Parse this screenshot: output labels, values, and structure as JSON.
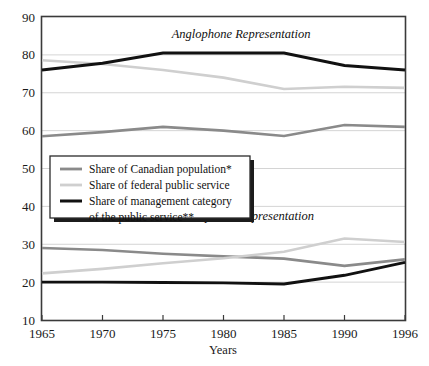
{
  "chart_data": {
    "type": "line",
    "title": "",
    "xlabel": "Years",
    "ylabel": "",
    "x": [
      1965,
      1970,
      1975,
      1980,
      1985,
      1990,
      1996
    ],
    "xtick_labels": [
      "1965",
      "1970",
      "1975",
      "1980",
      "1985",
      "1990",
      "1996"
    ],
    "ytick_labels": [
      "10",
      "20",
      "30",
      "40",
      "50",
      "60",
      "70",
      "80",
      "90"
    ],
    "yticks": [
      10,
      20,
      30,
      40,
      50,
      60,
      70,
      80,
      90
    ],
    "ylim": [
      10,
      90
    ],
    "grid": true,
    "legend_position": "center-left",
    "annotations": [
      {
        "text": "Anglophone Representation",
        "x": 1982,
        "y": 84.5
      },
      {
        "text": "Francophone Representation",
        "x": 1982,
        "y": 36.5
      }
    ],
    "series": [
      {
        "name": "Share of Canadian population*",
        "group": "Anglophone Representation",
        "color": "#8a8a8a",
        "width": 2.6,
        "values": [
          58.5,
          59.6,
          61.0,
          60.0,
          58.6,
          61.5,
          61.0
        ]
      },
      {
        "name": "Share of federal public service",
        "group": "Anglophone Representation",
        "color": "#cfcfcf",
        "width": 2.6,
        "values": [
          78.6,
          77.6,
          76.0,
          74.0,
          71.0,
          71.6,
          71.3
        ]
      },
      {
        "name": "Share of management category of the public service**",
        "group": "Anglophone Representation",
        "color": "#111111",
        "width": 2.9,
        "values": [
          76.0,
          77.8,
          80.5,
          80.5,
          80.5,
          77.2,
          76.0
        ]
      },
      {
        "name": "Share of Canadian population*",
        "group": "Francophone Representation",
        "color": "#8a8a8a",
        "width": 2.6,
        "values": [
          29.0,
          28.5,
          27.5,
          26.8,
          26.2,
          24.3,
          26.0
        ]
      },
      {
        "name": "Share of federal public service",
        "group": "Francophone Representation",
        "color": "#cfcfcf",
        "width": 2.6,
        "values": [
          22.3,
          23.5,
          25.0,
          26.3,
          28.0,
          31.5,
          30.6
        ]
      },
      {
        "name": "Share of management category of the public service**",
        "group": "Francophone Representation",
        "color": "#111111",
        "width": 2.9,
        "values": [
          20.0,
          20.0,
          19.9,
          19.8,
          19.5,
          21.8,
          25.2
        ]
      }
    ],
    "legend": [
      {
        "label": "Share of Canadian population*",
        "color": "#8a8a8a",
        "width": 2.8
      },
      {
        "label": "Share of federal public service",
        "color": "#cfcfcf",
        "width": 2.8
      },
      {
        "label": "Share of management category",
        "color": "#111111",
        "width": 3.0
      },
      {
        "label": "of the public service**",
        "color": null,
        "width": 0
      }
    ]
  }
}
